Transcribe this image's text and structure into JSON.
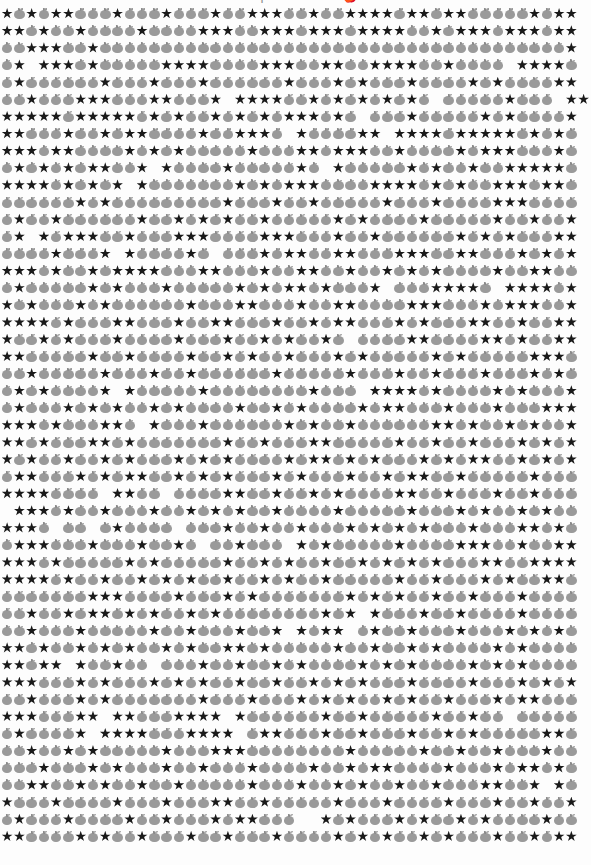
{
  "page": {
    "width": 591,
    "height": 865,
    "background_color": "#fdfdfd",
    "kind": "emoji-glyph-grid"
  },
  "title": {
    "text": "Recipe 1: ★ and 🍎",
    "visible": "clipped-at-top-edge",
    "color": "#8f8f8f"
  },
  "legend": {
    "star_glyph": "★",
    "star_name": "black-star",
    "star_color": "#1a1a1a",
    "apple_glyph": "🍎",
    "apple_name": "gray-apple",
    "apple_color": "#9a9a9a",
    "blank_glyph": " ",
    "blank_name": "space"
  },
  "grid": {
    "columns": 48,
    "rows": 49,
    "cell_width_px": 12.28,
    "row_height_px": 17.15,
    "rows_data": [
      "*o*o**ooo*ooo*ooo*oo***oo*oo****o**o**ooooo*o**",
      "**o*oo*oooo*oooo***oo***o***o****oo*o***o***o**",
      "oo***oo*oooooooooooooooooooooooooooooooooooooo*",
      "o* ***o*ooooo****oooo***oo**oo****oo*oooo ****o",
      "o*oooooo*ooo*ooo*oooooo*ooo*o*ooo*oooo*o*oooo**",
      "oo*ooo***ooo**ooo* ****oo*o*o*o*o*o ooooo*ooo *****",
      "*****o*****o*o*oo*o*o*o***o*o ooo*ooooo*o*oooo*",
      "**ooo*oo*o**oooo*oo***o *oooo** ****o*****o*o*o",
      "***o**oooo*o*o*ooooo*ooo**o***oo*oooo*o***ooo*o",
      "o*o*o*o**oo* *oooo*ooooo*o *ooooo*o*oo*oo*****o",
      "****o*o*o* *ooooooo*o*o***oooo****o*o*oo***o**o",
      "oooooo*o*ooooooooo*ooo*oo*ooooo*ooo*oooo***oooo",
      "o*oo*oooooo*oo*o*o*oo*ooooo*o*oooo*ooooo*oo*oo*",
      "o* *o***oo*ooo***oooo***ooo*oo*oooooo*o*o*ooo**",
      "oooo*ooo* *oooo*o ooo*o**oo**ooo***oo**ooo*o*o*",
      "***o*oo*o****ooo**ooo*oo**oo*oo*o*o*oooo*oo**oo",
      "o*ooooo*o*ooo*ooooo*o*o**o*ooo* ooo****o ****o*",
      "*o*ooo*o*oooooo*ooo**ooo*oo**oooo***ooo*o***oo*",
      "****o*ooo**ooo*oo**ooo*oo*o**ooo*o*ooo**oo*oo**",
      "*oo*o*ooo*oooo*ooo*oo*o*oo*o oooo**oooo**o*oo**",
      "**ooooo*oo*oooo*oo*o*oo*ooo*o*ooooo*o*ooooo***o",
      "oo*ooooo*ooo*oo*oooooo*ooooo*ooo*oo*ooo*ooo*o*o",
      "o*o*oooo* *ooooo*oooooooo*ooo ****o*oooo*o*ooo*",
      "o*ooo*o*o*oo*o*oooo*oo*o*oooo*o**ooo*ooo*ooo***",
      "***o*ooo**o *ooo*oooooo*o*oo*oooooo**o*oo*o*oo*",
      "**o*ooo**o*ooooooo*oo*ooo**ooooo*oo*oo*ooo*o*o*",
      "*o*oo*oo*o*ooo*o*o*oooo*o**o*o*ooo*o*o**oo*o*o*",
      "o**ooo*o*o**oo*o*o*ooo*o*ooo*oo*o**oo*ooooo*ooo",
      "****oooo **oo oooo**oo*oo*o*oooo**oo*ooo*oo*ooo",
      " ***o*oo*ooo*oo*o*o*oo*oooo*ooooo*ooo*o*oo*o*oo",
      "***o oo o*oooo ooo*oo*oo*ooo*o*o*o*ooo*ooo**o*o",
      "o***ooo*ooo*oo*o oo*ooo *o*ooooo*oooo***oo*oo**",
      "***o*ooooo*o*ooooo*oo*o*oo*oo*o*o*o*ooo**oo****",
      "****o*oo*oo*o*o*oo*oo*o*oo*ooooo*oo*ooo*o*oo**o",
      "ooooooo***oooo*ooo*o*ooooooo*o*o*oo*oo*ooo*oooo",
      "oo*oo*o**o*o*oo*o*oooooooo*o* *ooo*oo*oooo*oooo",
      "oo*ooo*ooooo*oo*ooo*oo* *o** o*oo*ooo*ooo*o*o*o",
      "**o*oo*o*o*oo*o*oo**o*ooooo*oo*oo*o*oooo*o*oooo",
      "**o** *oo*oo ooo*oo*oo*o*oooo*o*o*oooo*o*o*oooo",
      "***ooo*o*ooo*o*o*oo*oo*oo*o*o*ooo*oooo*ooo*o*o*",
      "oo*ooo*o*ooooooo*ooo*ooo*o*o*oo*o*oo*ooo*o**ooo",
      "***ooo** **ooo**** *oooooo*oo*ooooo*oo*oo ooooo",
      "o*oooo* ****ooo**** o**ooo*oo*ooo*oo*o*ooooo**o",
      "oo*oo*o*ooooo*ooo***oooooooo*ooooo*oo*oo*ooo*oo",
      "ooo*ooo*o*ooo*oo*ooo*oooo*oo*o**oooo*ooo*o**o*o",
      "oo**oo*o*oo*oo*ooooo*ooo*oo*o*oo*oo*ooo**oo* *o",
      "*ooo*oooo*ooo*ooo**oo*ooooo*ooo*oooo*ooo*oo*oo*",
      "o*ooo*oooo*oo*ooo*o**ooo  *o*ooo*o*oo*o*oooo*oo",
      "**oooo*o*oo*ooo*oo*ooo*oooo*o*o*oo*o*ooo*oo*o**"
    ]
  },
  "chart_data": {
    "type": "heatmap",
    "title": "Recipe 1: ★ and 🍎",
    "xlabel": "",
    "ylabel": "",
    "categories": [
      "star",
      "apple",
      "blank"
    ],
    "values": [
      0,
      0,
      0
    ],
    "legend_position": "none",
    "grid": false
  }
}
